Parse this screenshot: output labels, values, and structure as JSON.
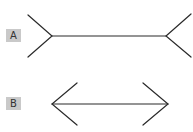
{
  "figure": {
    "stroke_color": "#2a2a2a",
    "label_bg": "#c9c9c9",
    "items": [
      {
        "label": "A",
        "variant": "fins-out",
        "shaft": {
          "x1": 52,
          "y1": 36,
          "x2": 166,
          "y2": 36
        },
        "left_fins": [
          [
            28,
            15
          ],
          [
            28,
            57
          ]
        ],
        "right_fins": [
          [
            191,
            14
          ],
          [
            191,
            57
          ]
        ]
      },
      {
        "label": "B",
        "variant": "arrowheads-in",
        "shaft": {
          "x1": 52,
          "y1": 104,
          "x2": 168,
          "y2": 104
        },
        "left_fins": [
          [
            77,
            83
          ],
          [
            77,
            125
          ]
        ],
        "right_fins": [
          [
            143,
            83
          ],
          [
            143,
            125
          ]
        ]
      }
    ]
  }
}
